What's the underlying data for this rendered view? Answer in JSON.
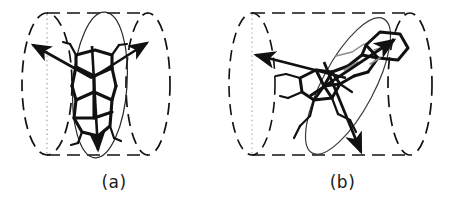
{
  "figure": {
    "background_color": "#ffffff",
    "stroke_color": "#111111",
    "panels": [
      {
        "id": "a",
        "label": "(a)",
        "description": "Polycyclic aromatic molecule oriented with its long axis parallel to the cylindrical channel axis",
        "cylinder": {
          "left_cap_style": "dashed-ellipse",
          "right_cap_style": "dashed-ellipse",
          "center_line_style": "dotted",
          "wall_style": "dashed",
          "left_cap_cx": 47,
          "right_cap_cx": 148,
          "cap_cy": 84,
          "cap_rx": 25,
          "cap_ry": 72,
          "top_y": 13,
          "bottom_y": 155
        },
        "molecular_plane": {
          "style": "solid-ellipse",
          "cx": 100,
          "cy": 85,
          "rx": 27,
          "ry": 73,
          "rotation_deg": 4
        },
        "arrows": [
          {
            "name": "transition-dipole-upper-left",
            "x1": 92,
            "y1": 78,
            "x2": 32,
            "y2": 44
          },
          {
            "name": "transition-dipole-upper-right",
            "x1": 92,
            "y1": 78,
            "x2": 148,
            "y2": 42
          },
          {
            "name": "long-axis-down",
            "x1": 92,
            "y1": 46,
            "x2": 98,
            "y2": 150
          }
        ]
      },
      {
        "id": "b",
        "label": "(b)",
        "description": "Polycyclic molecule tilted diagonally with respect to the cylindrical channel axis",
        "cylinder": {
          "left_cap_style": "dotted-ellipse",
          "right_cap_style": "dashed-ellipse",
          "center_line_style": "dotted",
          "wall_style": "dashed",
          "left_cap_cx": 24,
          "right_cap_cx": 182,
          "cap_cy": 84,
          "cap_rx": 24,
          "cap_ry": 72,
          "top_y": 13,
          "bottom_y": 155
        },
        "molecular_plane": {
          "style": "solid-ellipse",
          "cx": 120,
          "cy": 86,
          "rx": 26,
          "ry": 76,
          "rotation_deg": 28
        },
        "arrows": [
          {
            "name": "transition-dipole-left",
            "x1": 118,
            "y1": 78,
            "x2": 28,
            "y2": 54
          },
          {
            "name": "transition-dipole-upper-right",
            "x1": 82,
            "y1": 96,
            "x2": 168,
            "y2": 38
          },
          {
            "name": "long-axis-down-right",
            "x1": 96,
            "y1": 62,
            "x2": 132,
            "y2": 152
          }
        ]
      }
    ]
  }
}
